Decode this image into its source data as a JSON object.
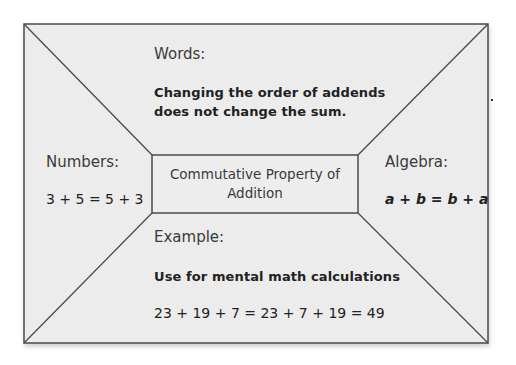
{
  "diagram": {
    "type": "frayer-model",
    "colors": {
      "fill": "#ececec",
      "stroke": "#4a4a4a",
      "background": "#ffffff"
    },
    "center": {
      "title_line1": "Commutative Property of",
      "title_line2": "Addition"
    },
    "top": {
      "heading": "Words:",
      "line1": "Changing the order of addends",
      "line2": "does not change the sum."
    },
    "left": {
      "heading": "Numbers:",
      "content": "3 + 5 = 5 + 3"
    },
    "right": {
      "heading": "Algebra:",
      "content": "a + b = b + a"
    },
    "bottom": {
      "heading": "Example:",
      "line1": "Use for mental math calculations",
      "line2": "23 + 19 + 7 = 23 + 7 + 19 = 49"
    }
  }
}
